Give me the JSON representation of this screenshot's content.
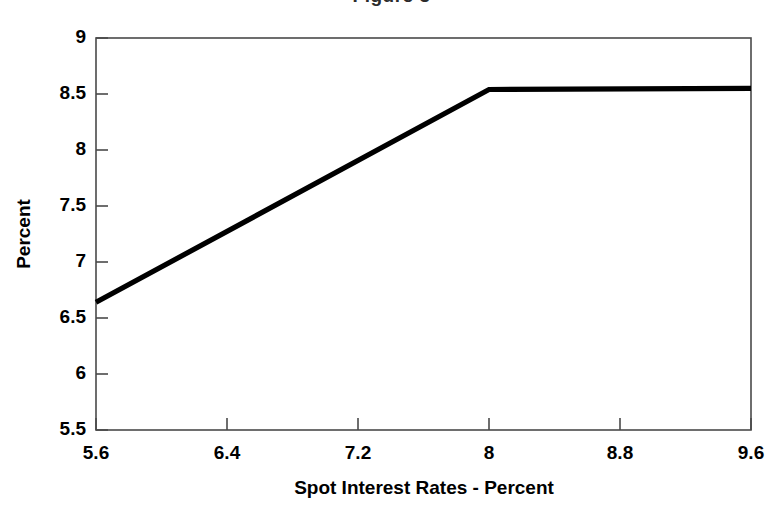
{
  "figure": {
    "background_color": "#ffffff",
    "frame_color": "#4a4a4a",
    "line_color": "#000000",
    "title_remnant": "Figure 3"
  },
  "chart_data": {
    "type": "line",
    "title": "",
    "xlabel": "Spot Interest Rates - Percent",
    "ylabel": "Percent",
    "xlim": [
      5.6,
      9.6
    ],
    "ylim": [
      5.5,
      9
    ],
    "xticks": [
      5.6,
      6.4,
      7.2,
      8,
      8.8,
      9.6
    ],
    "xtick_labels": [
      "5.6",
      "6.4",
      "7.2",
      "8",
      "8.8",
      "9.6"
    ],
    "yticks": [
      5.5,
      6,
      6.5,
      7,
      7.5,
      8,
      8.5,
      9
    ],
    "ytick_labels": [
      "5.5",
      "6",
      "6.5",
      "7",
      "7.5",
      "8",
      "8.5",
      "9"
    ],
    "grid": false,
    "legend": null,
    "series": [
      {
        "name": "Yield",
        "x": [
          5.6,
          8.0,
          9.6
        ],
        "values": [
          6.64,
          8.54,
          8.55
        ]
      }
    ]
  }
}
